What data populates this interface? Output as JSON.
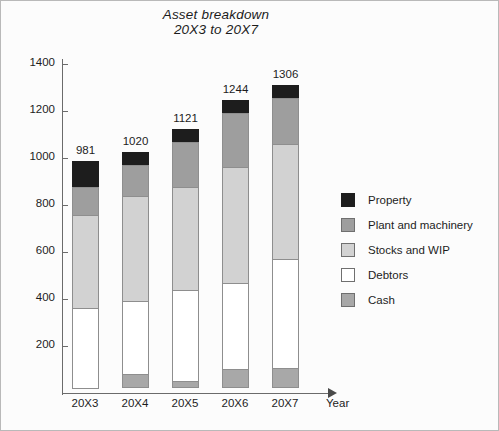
{
  "chart_data": {
    "type": "bar",
    "stacked": true,
    "title": "Asset breakdown",
    "subtitle": "20X3 to 20X7",
    "xlabel": "Year",
    "ylabel": "",
    "grid": false,
    "legend_position": "right",
    "categories": [
      "20X3",
      "20X4",
      "20X5",
      "20X6",
      "20X7"
    ],
    "ylim": [
      0,
      1400
    ],
    "yticks": [
      200,
      400,
      600,
      800,
      1000,
      1200,
      1400
    ],
    "totals": [
      981,
      1020,
      1121,
      1244,
      1306
    ],
    "series": [
      {
        "name": "Cash",
        "color": "#a8a8a8",
        "values": [
          0,
          60,
          30,
          80,
          85
        ]
      },
      {
        "name": "Debtors",
        "color": "#ffffff",
        "values": [
          345,
          315,
          390,
          370,
          470
        ]
      },
      {
        "name": "Stocks and WIP",
        "color": "#d2d2d2",
        "values": [
          400,
          450,
          445,
          500,
          490
        ]
      },
      {
        "name": "Plant and machinery",
        "color": "#9e9e9e",
        "values": [
          125,
          135,
          196,
          234,
          201
        ]
      },
      {
        "name": "Property",
        "color": "#1d1d1d",
        "values": [
          111,
          60,
          60,
          60,
          60
        ]
      }
    ],
    "legend": [
      {
        "label": "Property",
        "color": "#1d1d1d"
      },
      {
        "label": "Plant and machinery",
        "color": "#9e9e9e"
      },
      {
        "label": "Stocks and WIP",
        "color": "#d2d2d2"
      },
      {
        "label": "Debtors",
        "color": "#ffffff"
      },
      {
        "label": "Cash",
        "color": "#a8a8a8"
      }
    ]
  }
}
